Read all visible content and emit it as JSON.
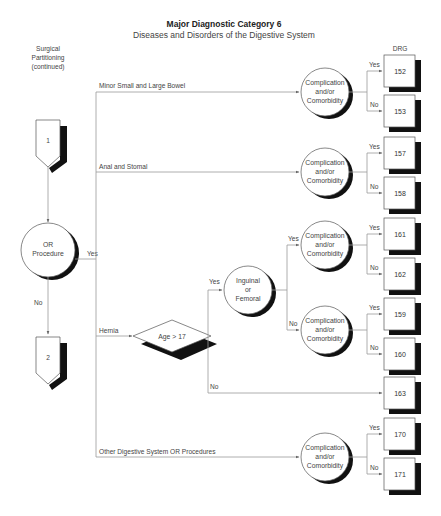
{
  "header": {
    "title": "Major Diagnostic Category 6",
    "subtitle": "Diseases and Disorders of the Digestive System"
  },
  "left_label": {
    "lines": [
      "Surgical",
      "Partitioning",
      "(continued)"
    ]
  },
  "drg_header": "DRG",
  "connectors": {
    "start": "1",
    "end": "2"
  },
  "decision_or": {
    "lines": [
      "OR",
      "Procedure"
    ],
    "yes": "Yes",
    "no": "No"
  },
  "branches": [
    {
      "label": "Minor Small and Large Bowel"
    },
    {
      "label": "Anal and Stomal"
    },
    {
      "label": "Hernia"
    },
    {
      "label": "Other Digestive System OR Procedures"
    }
  ],
  "age_decision": {
    "label": "Age > 17",
    "yes": "Yes",
    "no": "No"
  },
  "inguinal": {
    "lines": [
      "Inguinal",
      "or",
      "Femoral"
    ],
    "yes": "Yes",
    "no": "No"
  },
  "cc": {
    "lines": [
      "Complication",
      "and/or",
      "Comorbidity"
    ],
    "yes": "Yes",
    "no": "No"
  },
  "drg_boxes": [
    "152",
    "153",
    "157",
    "158",
    "161",
    "162",
    "159",
    "160",
    "163",
    "170",
    "171"
  ]
}
